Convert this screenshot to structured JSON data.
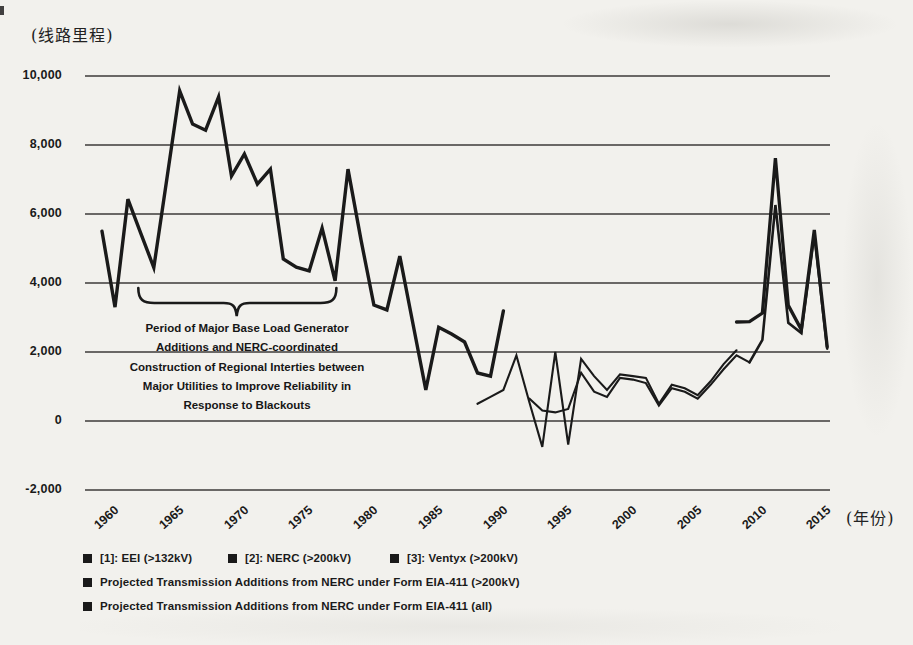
{
  "figure": {
    "background": "#f2f1ed",
    "ink_color": "#1a1a1a"
  },
  "axes": {
    "y_unit_label": "(线路里程)",
    "x_unit_label": "(年份)",
    "y_ticks": [
      {
        "label": "10,000",
        "value": 10000
      },
      {
        "label": "8,000",
        "value": 8000
      },
      {
        "label": "6,000",
        "value": 6000
      },
      {
        "label": "4,000",
        "value": 4000
      },
      {
        "label": "2,000",
        "value": 2000
      },
      {
        "label": "0",
        "value": 0
      },
      {
        "label": "-2,000",
        "value": -2000
      }
    ],
    "x_ticks": [
      {
        "label": "1960",
        "year": 1960
      },
      {
        "label": "1965",
        "year": 1965
      },
      {
        "label": "1970",
        "year": 1970
      },
      {
        "label": "1975",
        "year": 1975
      },
      {
        "label": "1980",
        "year": 1980
      },
      {
        "label": "1985",
        "year": 1985
      },
      {
        "label": "1990",
        "year": 1990
      },
      {
        "label": "1995",
        "year": 1995
      },
      {
        "label": "2000",
        "year": 2000
      },
      {
        "label": "2005",
        "year": 2005
      },
      {
        "label": "2010",
        "year": 2010
      },
      {
        "label": "2015",
        "year": 2015
      }
    ]
  },
  "annotation": {
    "lines": [
      "Period of Major Base Load Generator",
      "Additions and NERC-coordinated",
      "Construction of Regional Interties between",
      "Major Utilities to Improve Reliability in",
      "Response to Blackouts"
    ]
  },
  "legend": {
    "items": [
      {
        "label": "[1]: EEI (>132kV)",
        "row": 1,
        "col": 0
      },
      {
        "label": "[2]: NERC (>200kV)",
        "row": 1,
        "col": 1
      },
      {
        "label": "[3]: Ventyx (>200kV)",
        "row": 1,
        "col": 2
      },
      {
        "label": "Projected Transmission Additions from NERC under Form EIA-411 (>200kV)",
        "row": 2,
        "col": 0
      },
      {
        "label": "Projected Transmission Additions from NERC under Form EIA-411 (all)",
        "row": 3,
        "col": 0
      }
    ]
  },
  "chart_data": {
    "type": "line",
    "title": "",
    "xlabel": "(年份)",
    "ylabel": "(线路里程)",
    "xlim": [
      1958.5,
      2018
    ],
    "ylim": [
      -2000,
      10000
    ],
    "grid": "horizontal",
    "legend_position": "bottom-left",
    "annotation_text": "Period of Major Base Load Generator Additions and NERC-coordinated Construction of Regional Interties between Major Utilities to Improve Reliability in Response to Blackouts",
    "brace": {
      "from_year": 1962.8,
      "mid_year": 1970.4,
      "to_year": 1978.1
    },
    "series": [
      {
        "id": "eei",
        "name": "[1]: EEI (>132kV)",
        "points": [
          [
            1960,
            5500
          ],
          [
            1961,
            3300
          ],
          [
            1962,
            6430
          ],
          [
            1963,
            5440
          ],
          [
            1964,
            4450
          ],
          [
            1965,
            7010
          ],
          [
            1966,
            9570
          ],
          [
            1967,
            8610
          ],
          [
            1968,
            8430
          ],
          [
            1969,
            9390
          ],
          [
            1970,
            7100
          ],
          [
            1971,
            7740
          ],
          [
            1972,
            6870
          ],
          [
            1973,
            7300
          ],
          [
            1974,
            4700
          ],
          [
            1975,
            4460
          ],
          [
            1976,
            4350
          ],
          [
            1977,
            5590
          ],
          [
            1978,
            4060
          ],
          [
            1979,
            7300
          ],
          [
            1980,
            5250
          ],
          [
            1981,
            3360
          ],
          [
            1982,
            3220
          ],
          [
            1983,
            4780
          ],
          [
            1984,
            2840
          ],
          [
            1985,
            900
          ],
          [
            1986,
            2720
          ],
          [
            1987,
            2520
          ],
          [
            1988,
            2290
          ],
          [
            1989,
            1390
          ],
          [
            1990,
            1300
          ],
          [
            1991,
            3190
          ]
        ]
      },
      {
        "id": "nerc",
        "name": "[2]: NERC (>200kV)",
        "points": [
          [
            1989,
            500
          ],
          [
            1990,
            700
          ],
          [
            1991,
            900
          ],
          [
            1992,
            1900
          ],
          [
            1993,
            550
          ],
          [
            1994,
            -750
          ],
          [
            1995,
            2000
          ],
          [
            1996,
            -680
          ],
          [
            1997,
            1800
          ],
          [
            1998,
            1300
          ],
          [
            1999,
            900
          ],
          [
            2000,
            1350
          ],
          [
            2001,
            1300
          ],
          [
            2002,
            1250
          ],
          [
            2003,
            500
          ],
          [
            2004,
            1050
          ],
          [
            2005,
            950
          ],
          [
            2006,
            750
          ],
          [
            2007,
            1150
          ],
          [
            2008,
            1650
          ],
          [
            2009,
            2050
          ]
        ]
      },
      {
        "id": "ventyx",
        "name": "[3]: Ventyx (>200kV)",
        "points": [
          [
            1993,
            650
          ],
          [
            1994,
            300
          ],
          [
            1995,
            250
          ],
          [
            1996,
            350
          ],
          [
            1997,
            1400
          ],
          [
            1998,
            850
          ],
          [
            1999,
            700
          ],
          [
            2000,
            1250
          ],
          [
            2001,
            1200
          ],
          [
            2002,
            1100
          ],
          [
            2003,
            450
          ],
          [
            2004,
            950
          ],
          [
            2005,
            850
          ],
          [
            2006,
            650
          ],
          [
            2007,
            1050
          ],
          [
            2008,
            1500
          ],
          [
            2009,
            1900
          ],
          [
            2010,
            1700
          ]
        ]
      },
      {
        "id": "proj200",
        "name": "Projected Transmission Additions from NERC under Form EIA-411 (>200kV)",
        "points": [
          [
            2010,
            1700
          ],
          [
            2011,
            2350
          ],
          [
            2012,
            6260
          ],
          [
            2013,
            2850
          ],
          [
            2014,
            2550
          ],
          [
            2015,
            5400
          ],
          [
            2016,
            2100
          ]
        ]
      },
      {
        "id": "projall",
        "name": "Projected Transmission Additions from NERC under Form EIA-411 (all)",
        "points": [
          [
            2009,
            2870
          ],
          [
            2010,
            2880
          ],
          [
            2011,
            3130
          ],
          [
            2012,
            7620
          ],
          [
            2013,
            3350
          ],
          [
            2014,
            2650
          ],
          [
            2015,
            5540
          ],
          [
            2016,
            2150
          ]
        ]
      }
    ]
  }
}
